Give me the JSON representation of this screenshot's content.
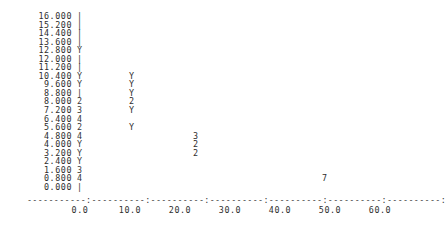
{
  "chart_data": {
    "type": "scatter",
    "title": "",
    "xlabel": "",
    "ylabel": "",
    "style": "ascii-character-plot",
    "grid": false,
    "legend": null,
    "xlim": [
      0.0,
      60.0
    ],
    "ylim": [
      0.0,
      16.0
    ],
    "x_ticks": [
      "0.0",
      "10.0",
      "20.0",
      "30.0",
      "40.0",
      "50.0",
      "60.0"
    ],
    "x_tick_values": [
      0.0,
      10.0,
      20.0,
      30.0,
      40.0,
      50.0,
      60.0
    ],
    "y_ticks": [
      "16.000",
      "15.200",
      "14.400",
      "13.600",
      "12.800",
      "12.000",
      "11.200",
      "10.400",
      "9.600",
      "8.800",
      "8.000",
      "7.200",
      "6.400",
      "5.600",
      "4.800",
      "4.000",
      "3.200",
      "2.400",
      "1.600",
      "0.800",
      "0.000"
    ],
    "y_tick_values": [
      16.0,
      15.2,
      14.4,
      13.6,
      12.8,
      12.0,
      11.2,
      10.4,
      9.6,
      8.8,
      8.0,
      7.2,
      6.4,
      5.6,
      4.8,
      4.0,
      3.2,
      2.4,
      1.6,
      0.8,
      0.0
    ],
    "axis_char": "|",
    "axis_line": "-----------:----------:----------:----------:----------:----------:----------:",
    "marker_note": "Y denotes a single observation; digits denote that many overlapping observations at the cell.",
    "points": [
      {
        "y_label": "16.000",
        "y": 16.0,
        "x": 0.0,
        "marker": "|",
        "count": 0
      },
      {
        "y_label": "15.200",
        "y": 15.2,
        "x": 0.0,
        "marker": "|",
        "count": 0
      },
      {
        "y_label": "14.400",
        "y": 14.4,
        "x": 0.0,
        "marker": "|",
        "count": 0
      },
      {
        "y_label": "13.600",
        "y": 13.6,
        "x": 0.0,
        "marker": "|",
        "count": 0
      },
      {
        "y_label": "12.800",
        "y": 12.8,
        "x": 0.0,
        "marker": "Y",
        "count": 1
      },
      {
        "y_label": "12.000",
        "y": 12.0,
        "x": 0.0,
        "marker": "|",
        "count": 0
      },
      {
        "y_label": "11.200",
        "y": 11.2,
        "x": 0.0,
        "marker": "|",
        "count": 0
      },
      {
        "y_label": "10.400",
        "y": 10.4,
        "x": 0.0,
        "marker": "Y",
        "count": 1
      },
      {
        "y_label": "10.400",
        "y": 10.4,
        "x": 10.4,
        "marker": "Y",
        "count": 1
      },
      {
        "y_label": "9.600",
        "y": 9.6,
        "x": 0.0,
        "marker": "Y",
        "count": 1
      },
      {
        "y_label": "9.600",
        "y": 9.6,
        "x": 10.4,
        "marker": "Y",
        "count": 1
      },
      {
        "y_label": "8.800",
        "y": 8.8,
        "x": 0.0,
        "marker": "|",
        "count": 0
      },
      {
        "y_label": "8.800",
        "y": 8.8,
        "x": 10.4,
        "marker": "Y",
        "count": 1
      },
      {
        "y_label": "8.000",
        "y": 8.0,
        "x": 0.0,
        "marker": "2",
        "count": 2
      },
      {
        "y_label": "8.000",
        "y": 8.0,
        "x": 10.4,
        "marker": "2",
        "count": 2
      },
      {
        "y_label": "7.200",
        "y": 7.2,
        "x": 0.0,
        "marker": "3",
        "count": 3
      },
      {
        "y_label": "7.200",
        "y": 7.2,
        "x": 10.4,
        "marker": "Y",
        "count": 1
      },
      {
        "y_label": "6.400",
        "y": 6.4,
        "x": 0.0,
        "marker": "4",
        "count": 4
      },
      {
        "y_label": "5.600",
        "y": 5.6,
        "x": 0.0,
        "marker": "2",
        "count": 2
      },
      {
        "y_label": "5.600",
        "y": 5.6,
        "x": 10.4,
        "marker": "Y",
        "count": 1
      },
      {
        "y_label": "4.800",
        "y": 4.8,
        "x": 0.0,
        "marker": "4",
        "count": 4
      },
      {
        "y_label": "4.800",
        "y": 4.8,
        "x": 23.2,
        "marker": "3",
        "count": 3
      },
      {
        "y_label": "4.000",
        "y": 4.0,
        "x": 0.0,
        "marker": "Y",
        "count": 1
      },
      {
        "y_label": "4.000",
        "y": 4.0,
        "x": 23.2,
        "marker": "2",
        "count": 2
      },
      {
        "y_label": "3.200",
        "y": 3.2,
        "x": 0.0,
        "marker": "Y",
        "count": 1
      },
      {
        "y_label": "3.200",
        "y": 3.2,
        "x": 23.2,
        "marker": "2",
        "count": 2
      },
      {
        "y_label": "2.400",
        "y": 2.4,
        "x": 0.0,
        "marker": "Y",
        "count": 1
      },
      {
        "y_label": "1.600",
        "y": 1.6,
        "x": 0.0,
        "marker": "3",
        "count": 3
      },
      {
        "y_label": "0.800",
        "y": 0.8,
        "x": 0.0,
        "marker": "4",
        "count": 4
      },
      {
        "y_label": "0.800",
        "y": 0.8,
        "x": 49.0,
        "marker": "7",
        "count": 7
      },
      {
        "y_label": "0.000",
        "y": 0.0,
        "x": 0.0,
        "marker": "|",
        "count": 0
      }
    ]
  },
  "rows": [
    {
      "label": "16.000",
      "axis": "|",
      "markers": []
    },
    {
      "label": "15.200",
      "axis": "|",
      "markers": []
    },
    {
      "label": "14.400",
      "axis": "|",
      "markers": []
    },
    {
      "label": "13.600",
      "axis": "|",
      "markers": []
    },
    {
      "label": "12.800",
      "axis": "Y",
      "markers": []
    },
    {
      "label": "12.000",
      "axis": "|",
      "markers": []
    },
    {
      "label": "11.200",
      "axis": "|",
      "markers": []
    },
    {
      "label": "10.400",
      "axis": "Y",
      "markers": [
        {
          "char": "Y",
          "left": 129
        }
      ]
    },
    {
      "label": "9.600",
      "axis": "Y",
      "markers": [
        {
          "char": "Y",
          "left": 129
        }
      ]
    },
    {
      "label": "8.800",
      "axis": "|",
      "markers": [
        {
          "char": "Y",
          "left": 129
        }
      ]
    },
    {
      "label": "8.000",
      "axis": "2",
      "markers": [
        {
          "char": "2",
          "left": 129
        }
      ]
    },
    {
      "label": "7.200",
      "axis": "3",
      "markers": [
        {
          "char": "Y",
          "left": 129
        }
      ]
    },
    {
      "label": "6.400",
      "axis": "4",
      "markers": []
    },
    {
      "label": "5.600",
      "axis": "2",
      "markers": [
        {
          "char": "Y",
          "left": 129
        }
      ]
    },
    {
      "label": "4.800",
      "axis": "4",
      "markers": [
        {
          "char": "3",
          "left": 193
        }
      ]
    },
    {
      "label": "4.000",
      "axis": "Y",
      "markers": [
        {
          "char": "2",
          "left": 193
        }
      ]
    },
    {
      "label": "3.200",
      "axis": "Y",
      "markers": [
        {
          "char": "2",
          "left": 193
        }
      ]
    },
    {
      "label": "2.400",
      "axis": "Y",
      "markers": []
    },
    {
      "label": "1.600",
      "axis": "3",
      "markers": []
    },
    {
      "label": "0.800",
      "axis": "4",
      "markers": [
        {
          "char": "7",
          "left": 322
        }
      ]
    },
    {
      "label": "0.000",
      "axis": "|",
      "markers": []
    }
  ],
  "xaxis": {
    "line": "-----------:----------:----------:----------:----------:----------:----------:",
    "ticks": [
      {
        "label": "0.0",
        "left": 65
      },
      {
        "label": "10.0",
        "left": 115
      },
      {
        "label": "20.0",
        "left": 165
      },
      {
        "label": "30.0",
        "left": 215
      },
      {
        "label": "40.0",
        "left": 265
      },
      {
        "label": "50.0",
        "left": 315
      },
      {
        "label": "60.0",
        "left": 365
      }
    ]
  }
}
